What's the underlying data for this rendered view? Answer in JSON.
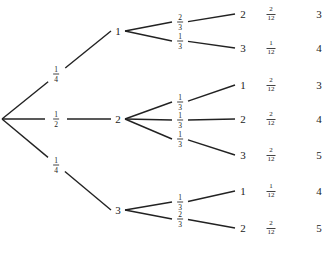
{
  "diagram": {
    "type": "probability-tree",
    "root": {
      "x": 2,
      "y": 119
    },
    "first_level": [
      {
        "outcome": "1",
        "prob_num": "1",
        "prob_den": "4",
        "node": {
          "x": 118,
          "y": 31
        },
        "label_pos": {
          "x": 56,
          "y": 74
        }
      },
      {
        "outcome": "2",
        "prob_num": "1",
        "prob_den": "2",
        "node": {
          "x": 118,
          "y": 119
        },
        "label_pos": {
          "x": 56,
          "y": 119
        }
      },
      {
        "outcome": "3",
        "prob_num": "1",
        "prob_den": "4",
        "node": {
          "x": 118,
          "y": 210
        },
        "label_pos": {
          "x": 56,
          "y": 165
        }
      }
    ],
    "leaves": [
      {
        "parent": 0,
        "branch_num": "2",
        "branch_den": "3",
        "branch_pos": {
          "x": 180,
          "y": 22
        },
        "outcome": "2",
        "y": 14,
        "joint_num": "2",
        "joint_den": "12",
        "sum": "3"
      },
      {
        "parent": 0,
        "branch_num": "1",
        "branch_den": "3",
        "branch_pos": {
          "x": 180,
          "y": 41
        },
        "outcome": "3",
        "y": 48,
        "joint_num": "1",
        "joint_den": "12",
        "sum": "4"
      },
      {
        "parent": 1,
        "branch_num": "1",
        "branch_den": "3",
        "branch_pos": {
          "x": 180,
          "y": 102
        },
        "outcome": "1",
        "y": 85,
        "joint_num": "2",
        "joint_den": "12",
        "sum": "3"
      },
      {
        "parent": 1,
        "branch_num": "1",
        "branch_den": "3",
        "branch_pos": {
          "x": 180,
          "y": 120
        },
        "outcome": "2",
        "y": 119,
        "joint_num": "2",
        "joint_den": "12",
        "sum": "4"
      },
      {
        "parent": 1,
        "branch_num": "1",
        "branch_den": "3",
        "branch_pos": {
          "x": 180,
          "y": 139
        },
        "outcome": "3",
        "y": 155,
        "joint_num": "2",
        "joint_den": "12",
        "sum": "5"
      },
      {
        "parent": 2,
        "branch_num": "1",
        "branch_den": "3",
        "branch_pos": {
          "x": 180,
          "y": 202
        },
        "outcome": "1",
        "y": 191,
        "joint_num": "1",
        "joint_den": "12",
        "sum": "4"
      },
      {
        "parent": 2,
        "branch_num": "2",
        "branch_den": "3",
        "branch_pos": {
          "x": 180,
          "y": 219
        },
        "outcome": "2",
        "y": 228,
        "joint_num": "2",
        "joint_den": "12",
        "sum": "5"
      }
    ],
    "columns": {
      "leaf_x": 243,
      "prob_x": 271,
      "sum_x": 319
    },
    "line_color": "#222222"
  }
}
